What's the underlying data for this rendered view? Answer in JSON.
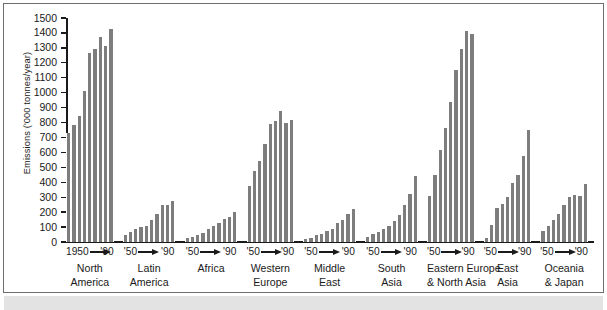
{
  "chart_data": {
    "type": "bar",
    "title": "",
    "xlabel": "",
    "ylabel": "Emissions ('000 tonnes/year)",
    "ylim": [
      0,
      1500
    ],
    "ytick_labels": [
      "0",
      "100",
      "200",
      "300",
      "400",
      "500",
      "600",
      "700",
      "800",
      "900",
      "1000",
      "1100",
      "1200",
      "1300",
      "1400",
      "1500"
    ],
    "ytick_values": [
      0,
      100,
      200,
      300,
      400,
      500,
      600,
      700,
      800,
      900,
      1000,
      1100,
      1200,
      1300,
      1400,
      1500
    ],
    "grid": false,
    "legend": null,
    "bar_color": "#7d7d7d",
    "axis_color": "#1a1a1a",
    "x_axis_note": "Each group spans 1950 to 1990 in 5-year steps (9 bars)",
    "categories": [
      "North America",
      "Latin America",
      "Africa",
      "Western Europe",
      "Middle East",
      "South Asia",
      "Eastern Europe & North Asia",
      "East Asia",
      "Oceania & Japan"
    ],
    "groups": [
      {
        "name": "North America",
        "name_lines": [
          "North",
          "America"
        ],
        "range_start": "1950",
        "range_end": "'90",
        "values": [
          730,
          785,
          845,
          1010,
          1265,
          1295,
          1370,
          1310,
          1425
        ]
      },
      {
        "name": "Latin America",
        "name_lines": [
          "Latin",
          "America"
        ],
        "range_start": "'50",
        "range_end": "'90",
        "values": [
          50,
          70,
          85,
          100,
          110,
          150,
          190,
          250,
          245,
          275
        ]
      },
      {
        "name": "Africa",
        "name_lines": [
          "Africa"
        ],
        "range_start": "'50",
        "range_end": "'90",
        "values": [
          25,
          35,
          48,
          60,
          85,
          108,
          125,
          152,
          168,
          200
        ]
      },
      {
        "name": "Western Europe",
        "name_lines": [
          "Western",
          "Europe"
        ],
        "range_start": "'50",
        "range_end": "'90",
        "values": [
          375,
          478,
          543,
          655,
          790,
          810,
          880,
          800,
          815
        ]
      },
      {
        "name": "Middle East",
        "name_lines": [
          "Middle",
          "East"
        ],
        "range_start": "'50",
        "range_end": "'90",
        "values": [
          22,
          30,
          45,
          55,
          72,
          88,
          125,
          150,
          190,
          220
        ]
      },
      {
        "name": "South Asia",
        "name_lines": [
          "South",
          "Asia"
        ],
        "range_start": "'50",
        "range_end": "'90",
        "values": [
          35,
          55,
          70,
          90,
          110,
          140,
          182,
          250,
          320,
          440
        ]
      },
      {
        "name": "Eastern Europe & North Asia",
        "name_lines": [
          "Eastern Europe",
          "& North Asia"
        ],
        "range_start": "'50",
        "range_end": "'90",
        "values": [
          308,
          450,
          615,
          765,
          935,
          1155,
          1295,
          1415,
          1395
        ]
      },
      {
        "name": "East Asia",
        "name_lines": [
          "East",
          "Asia"
        ],
        "range_start": "'50",
        "range_end": "'90",
        "values": [
          30,
          115,
          230,
          255,
          300,
          395,
          450,
          575,
          750
        ]
      },
      {
        "name": "Oceania & Japan",
        "name_lines": [
          "Oceania",
          "& Japan"
        ],
        "range_start": "'50",
        "range_end": "'90",
        "values": [
          75,
          110,
          150,
          190,
          250,
          300,
          315,
          305,
          390
        ]
      }
    ]
  }
}
